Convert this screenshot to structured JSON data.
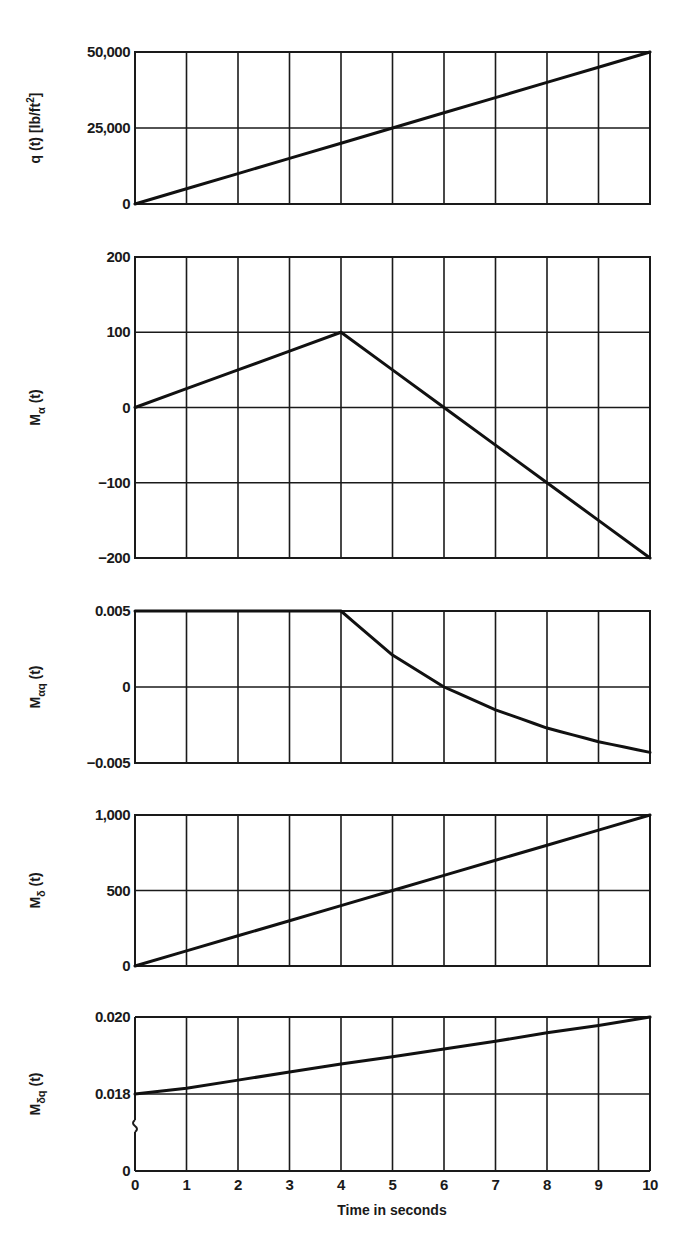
{
  "figure": {
    "x_axis_label": "Time in seconds",
    "x_ticks": [
      "0",
      "1",
      "2",
      "3",
      "4",
      "5",
      "6",
      "7",
      "8",
      "9",
      "10"
    ]
  },
  "panels": [
    {
      "id": "q",
      "ylabel_main": "q (t) [lb/ft",
      "ylabel_sup": "2",
      "ylabel_tail": "]",
      "yticks": [
        {
          "label": "50,000",
          "value": 50000
        },
        {
          "label": "25,000",
          "value": 25000
        },
        {
          "label": "0",
          "value": 0
        }
      ]
    },
    {
      "id": "M_alpha",
      "ylabel_main": "M",
      "ylabel_sub": "α",
      "ylabel_tail": " (t)",
      "yticks": [
        {
          "label": "200",
          "value": 200
        },
        {
          "label": "100",
          "value": 100
        },
        {
          "label": "0",
          "value": 0
        },
        {
          "label": "−100",
          "value": -100
        },
        {
          "label": "−200",
          "value": -200
        }
      ]
    },
    {
      "id": "M_alpha_q",
      "ylabel_main": "M",
      "ylabel_sub": "αq",
      "ylabel_tail": " (t)",
      "yticks": [
        {
          "label": "0.005",
          "value": 0.005
        },
        {
          "label": "0",
          "value": 0
        },
        {
          "label": "−0.005",
          "value": -0.005
        }
      ]
    },
    {
      "id": "M_delta",
      "ylabel_main": "M",
      "ylabel_sub": "δ",
      "ylabel_tail": " (t)",
      "yticks": [
        {
          "label": "1,000",
          "value": 1000
        },
        {
          "label": "500",
          "value": 500
        },
        {
          "label": "0",
          "value": 0
        }
      ]
    },
    {
      "id": "M_delta_q",
      "ylabel_main": "M",
      "ylabel_sub": "δq",
      "ylabel_tail": " (t)",
      "yticks": [
        {
          "label": "0.020",
          "value": 0.02
        },
        {
          "label": "0.018",
          "value": 0.018
        },
        {
          "label": "0",
          "value": 0
        }
      ],
      "axis_break": true
    }
  ],
  "chart_data": [
    {
      "type": "line",
      "title": "",
      "xlabel": "Time in seconds",
      "ylabel": "q (t) [lb/ft^2]",
      "x": [
        0,
        1,
        2,
        3,
        4,
        5,
        6,
        7,
        8,
        9,
        10
      ],
      "series": [
        {
          "name": "q(t)",
          "values": [
            0,
            5000,
            10000,
            15000,
            20000,
            25000,
            30000,
            35000,
            40000,
            45000,
            50000
          ]
        }
      ],
      "ylim": [
        0,
        50000
      ],
      "yticks": [
        0,
        25000,
        50000
      ],
      "grid": true
    },
    {
      "type": "line",
      "title": "",
      "xlabel": "Time in seconds",
      "ylabel": "M_α (t)",
      "x": [
        0,
        1,
        2,
        3,
        4,
        5,
        6,
        7,
        8,
        9,
        10
      ],
      "series": [
        {
          "name": "M_α(t)",
          "values": [
            0,
            25,
            50,
            75,
            100,
            50,
            0,
            -50,
            -100,
            -150,
            -200
          ]
        }
      ],
      "ylim": [
        -200,
        200
      ],
      "yticks": [
        -200,
        -100,
        0,
        100,
        200
      ],
      "grid": true
    },
    {
      "type": "line",
      "title": "",
      "xlabel": "Time in seconds",
      "ylabel": "M_αq (t)",
      "x": [
        0,
        1,
        2,
        3,
        4,
        5,
        6,
        7,
        8,
        9,
        10
      ],
      "series": [
        {
          "name": "M_αq(t)",
          "values": [
            0.005,
            0.005,
            0.005,
            0.005,
            0.005,
            0.0021,
            0.0,
            -0.0015,
            -0.0027,
            -0.0036,
            -0.0043
          ]
        }
      ],
      "ylim": [
        -0.005,
        0.005
      ],
      "yticks": [
        -0.005,
        0,
        0.005
      ],
      "grid": true
    },
    {
      "type": "line",
      "title": "",
      "xlabel": "Time in seconds",
      "ylabel": "M_δ (t)",
      "x": [
        0,
        1,
        2,
        3,
        4,
        5,
        6,
        7,
        8,
        9,
        10
      ],
      "series": [
        {
          "name": "M_δ(t)",
          "values": [
            0,
            100,
            200,
            300,
            400,
            500,
            600,
            700,
            800,
            900,
            1000
          ]
        }
      ],
      "ylim": [
        0,
        1000
      ],
      "yticks": [
        0,
        500,
        1000
      ],
      "grid": true
    },
    {
      "type": "line",
      "title": "",
      "xlabel": "Time in seconds",
      "ylabel": "M_δq (t)",
      "x": [
        0,
        1,
        2,
        3,
        4,
        5,
        6,
        7,
        8,
        9,
        10
      ],
      "series": [
        {
          "name": "M_δq(t)",
          "values": [
            0.018,
            0.01815,
            0.01836,
            0.01857,
            0.01878,
            0.01897,
            0.01917,
            0.01937,
            0.01959,
            0.01978,
            0.02
          ]
        }
      ],
      "ylim": [
        0,
        0.02
      ],
      "yticks": [
        0,
        0.018,
        0.02
      ],
      "axis_break": "between 0 and 0.018",
      "grid": true
    }
  ]
}
